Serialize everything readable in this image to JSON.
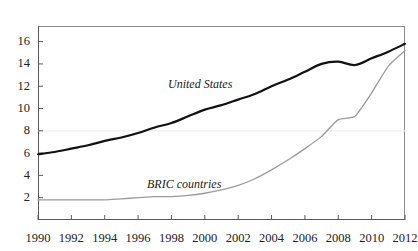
{
  "top_caption": "",
  "chart_data": {
    "type": "line",
    "title": "",
    "subtitle": "",
    "xlabel": "",
    "ylabel": "",
    "xlim": [
      1990,
      2012
    ],
    "ylim": [
      0,
      17.4
    ],
    "grid": false,
    "legend_position": "inline-annotations",
    "x_ticks": [
      "1990",
      "1992",
      "1994",
      "1996",
      "1998",
      "2000",
      "2002",
      "2004",
      "2006",
      "2008",
      "2010",
      "2012"
    ],
    "y_ticks": [
      "2",
      "4",
      "6",
      "8",
      "10",
      "12",
      "14",
      "16"
    ],
    "x": [
      1990,
      1991,
      1992,
      1993,
      1994,
      1995,
      1996,
      1997,
      1998,
      1999,
      2000,
      2001,
      2002,
      2003,
      2004,
      2005,
      2006,
      2007,
      2008,
      2009,
      2010,
      2011,
      2012
    ],
    "series": [
      {
        "name": "United States",
        "color": "#111111",
        "width": 2.2,
        "values": [
          5.9,
          6.1,
          6.4,
          6.7,
          7.1,
          7.4,
          7.8,
          8.3,
          8.7,
          9.3,
          9.9,
          10.3,
          10.8,
          11.3,
          12.0,
          12.6,
          13.3,
          14.0,
          14.2,
          13.9,
          14.5,
          15.1,
          15.8
        ]
      },
      {
        "name": "BRIC countries",
        "color": "#9b9b9b",
        "width": 1.3,
        "values": [
          1.8,
          1.8,
          1.8,
          1.8,
          1.8,
          1.9,
          2.0,
          2.1,
          2.1,
          2.2,
          2.4,
          2.7,
          3.1,
          3.7,
          4.5,
          5.4,
          6.4,
          7.5,
          9.0,
          9.3,
          11.4,
          13.8,
          15.2
        ]
      }
    ],
    "annotations": [
      {
        "text": "United States",
        "x": 2002,
        "y": 12.3,
        "style": "italic"
      },
      {
        "text": "BRIC countries",
        "x": 1998.8,
        "y": 4.4,
        "style": "italic"
      }
    ]
  }
}
